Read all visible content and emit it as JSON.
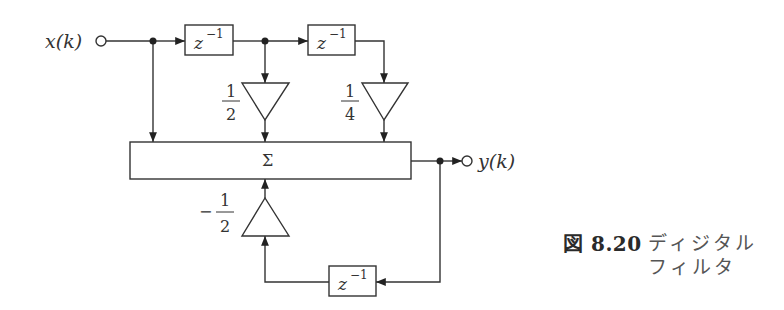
{
  "diagram": {
    "type": "digital-filter-block-diagram",
    "input": {
      "label": "x(k)"
    },
    "output": {
      "label": "y(k)"
    },
    "delays": [
      {
        "id": "delay-1",
        "label": "z",
        "exponent": "−1"
      },
      {
        "id": "delay-2",
        "label": "z",
        "exponent": "−1"
      },
      {
        "id": "delay-feedback",
        "label": "z",
        "exponent": "−1"
      }
    ],
    "gains": [
      {
        "id": "gain-half",
        "sign": "",
        "numerator": "1",
        "denominator": "2"
      },
      {
        "id": "gain-quarter",
        "sign": "",
        "numerator": "1",
        "denominator": "4"
      },
      {
        "id": "gain-neg-half",
        "sign": "−",
        "numerator": "1",
        "denominator": "2"
      }
    ],
    "summer": {
      "label": "Σ"
    }
  },
  "caption": {
    "number": "図 8.20",
    "title_line1": "ディジタル",
    "title_line2": "フィルタ"
  },
  "colors": {
    "stroke": "#333333",
    "background": "#ffffff"
  }
}
